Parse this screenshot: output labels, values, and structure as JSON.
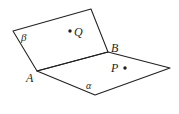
{
  "figure": {
    "background_color": "#ffffff",
    "stroke_color": "#231f20",
    "width": 179,
    "height": 114,
    "labels": {
      "plane_beta": "β",
      "plane_alpha": "α",
      "point_A": "A",
      "point_B": "B",
      "point_P": "P",
      "point_Q": "Q"
    },
    "geometry": {
      "upper_plane_beta": {
        "name": "beta",
        "polygon": "13,31 91,9 108,52 37,71",
        "vertices": [
          {
            "x": 13,
            "y": 31
          },
          {
            "x": 91,
            "y": 9
          },
          {
            "x": 108,
            "y": 52
          },
          {
            "x": 37,
            "y": 71
          }
        ]
      },
      "lower_plane_alpha": {
        "name": "alpha",
        "polygon": "37,71 108,52 170,68 95,95",
        "vertices": [
          {
            "x": 37,
            "y": 71
          },
          {
            "x": 108,
            "y": 52
          },
          {
            "x": 170,
            "y": 68
          },
          {
            "x": 95,
            "y": 95
          }
        ]
      },
      "intersection_line": {
        "from": {
          "x": 37,
          "y": 71,
          "label": "A"
        },
        "to": {
          "x": 108,
          "y": 52,
          "label": "B"
        }
      },
      "marked_points": [
        {
          "label": "Q",
          "dot_x": 70,
          "dot_y": 31,
          "dot_r": 1.7,
          "plane": "beta",
          "dot_side": "left"
        },
        {
          "label": "P",
          "dot_x": 125,
          "dot_y": 68,
          "dot_r": 1.7,
          "plane": "alpha",
          "dot_side": "right"
        }
      ]
    }
  }
}
